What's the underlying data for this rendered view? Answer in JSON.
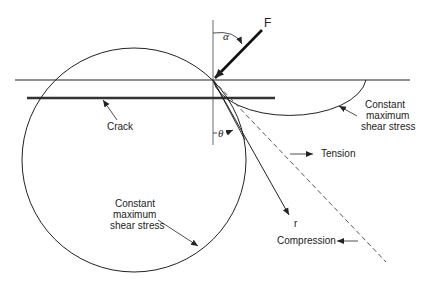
{
  "diagram": {
    "force": {
      "label": "F",
      "angle_label": "α"
    },
    "angle_theta": "θ",
    "radius_label": "r",
    "crack_label": "Crack",
    "small_circle_label": [
      "Constant",
      "maximum",
      "shear stress"
    ],
    "large_circle_label": [
      "Constant",
      "maximum",
      "shear stress"
    ],
    "tension_label": "Tension",
    "compression_label": "Compression",
    "colors": {
      "line": "#222222",
      "background": "#ffffff"
    }
  }
}
